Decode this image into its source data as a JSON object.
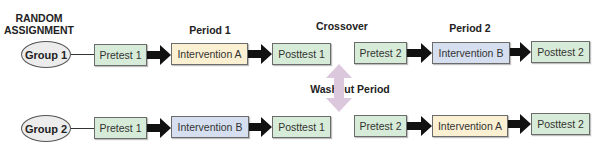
{
  "headers": {
    "random_assignment_line1": "RANDOM",
    "random_assignment_line2": "ASSIGNMENT",
    "period1": "Period 1",
    "crossover": "Crossover",
    "period2": "Period 2",
    "washout": "Washout Period"
  },
  "group1": {
    "label": "Group 1",
    "steps": [
      "Pretest 1",
      "Intervention A",
      "Posttest 1",
      "Pretest 2",
      "Intervention B",
      "Posttest 2"
    ]
  },
  "group2": {
    "label": "Group 2",
    "steps": [
      "Pretest 1",
      "Intervention B",
      "Posttest 1",
      "Pretest 2",
      "Intervention A",
      "Posttest 2"
    ]
  },
  "colors": {
    "test_box": "#d7ecd8",
    "intervention_a": "#fbf0d2",
    "intervention_b": "#d6dff0",
    "washout_arrow": "#dcc8dc",
    "arrow": "#111111"
  }
}
